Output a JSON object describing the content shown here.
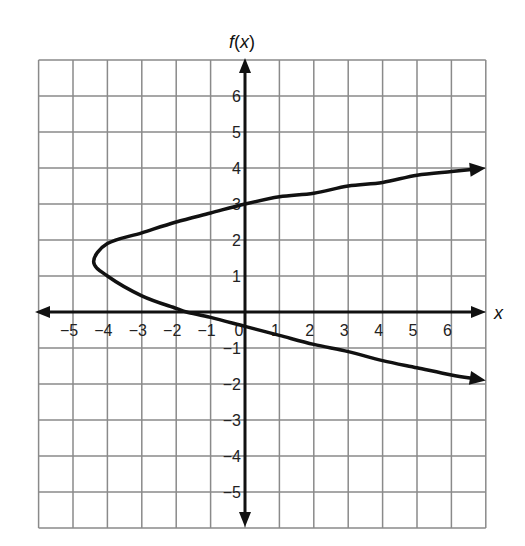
{
  "chart_data": {
    "type": "line",
    "title": "",
    "xlabel": "x",
    "ylabel": "f(x)",
    "xlim": [
      -6,
      7
    ],
    "ylim": [
      -6,
      7
    ],
    "grid": true,
    "x_ticks": [
      "−5",
      "−4",
      "−3",
      "−2",
      "−1",
      "0",
      "1",
      "2",
      "3",
      "4",
      "5",
      "6"
    ],
    "y_ticks": [
      "6",
      "5",
      "4",
      "3",
      "2",
      "1",
      "−1",
      "−2",
      "−3",
      "−4",
      "−5"
    ],
    "series": [
      {
        "name": "sideways parabola",
        "description": "Curve opening to the right with vertex near (-4.4, 1.4); arrows on both ends",
        "points": [
          [
            7.0,
            4.0
          ],
          [
            6,
            3.9
          ],
          [
            5,
            3.8
          ],
          [
            4,
            3.6
          ],
          [
            3,
            3.5
          ],
          [
            2,
            3.3
          ],
          [
            1,
            3.2
          ],
          [
            0,
            3.0
          ],
          [
            -1,
            2.75
          ],
          [
            -2,
            2.5
          ],
          [
            -3,
            2.2
          ],
          [
            -4,
            1.9
          ],
          [
            -4.4,
            1.4
          ],
          [
            -4,
            1.0
          ],
          [
            -3,
            0.45
          ],
          [
            -2,
            0.1
          ],
          [
            -1.7,
            0
          ],
          [
            -1,
            -0.15
          ],
          [
            0,
            -0.4
          ],
          [
            1,
            -0.65
          ],
          [
            2,
            -0.9
          ],
          [
            3,
            -1.1
          ],
          [
            4,
            -1.35
          ],
          [
            5,
            -1.55
          ],
          [
            6,
            -1.75
          ],
          [
            7.0,
            -1.9
          ]
        ],
        "y_intercepts": [
          3,
          -0.4
        ],
        "x_intercept": -1.7,
        "vertex": [
          -4.4,
          1.4
        ]
      }
    ]
  },
  "labels": {
    "y_axis_f": "f",
    "y_axis_paren": "(",
    "y_axis_var": "x",
    "y_axis_close": ")",
    "x_axis": "x"
  }
}
